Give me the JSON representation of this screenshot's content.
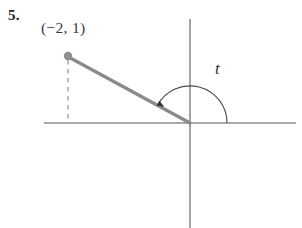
{
  "figure": {
    "problem_number": "5.",
    "point_label": "(−2, 1)",
    "angle_label": "t",
    "colors": {
      "background": "#ffffff",
      "axis": "#8c8c8c",
      "ray": "#8a8a8a",
      "point": "#8f8f8f",
      "dashed": "#9a9a9a",
      "arc": "#4a4a4a",
      "text": "#2b2b2b"
    },
    "geometry": {
      "origin_px": [
        190,
        123
      ],
      "point_px": [
        68,
        56
      ],
      "x_axis_px": [
        44,
        123,
        296,
        123
      ],
      "y_axis_px": [
        190,
        19,
        190,
        228
      ],
      "dashed_px": [
        68,
        60,
        68,
        123
      ],
      "arc_radius_px": 37,
      "arc_start_deg": 0,
      "arc_end_deg": 151.6
    },
    "data": {
      "point_x": -2,
      "point_y": 1,
      "angle_symbol": "t",
      "angle_direction": "counterclockwise"
    }
  }
}
